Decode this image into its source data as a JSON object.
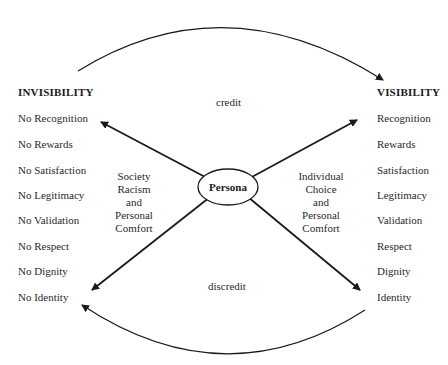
{
  "left": {
    "heading": "INVISIBILITY",
    "items": [
      "No Recognition",
      "No Rewards",
      "No Satisfaction",
      "No Legitimacy",
      "No Validation",
      "No Respect",
      "No Dignity",
      "No Identity"
    ]
  },
  "right": {
    "heading": "VISIBILITY",
    "items": [
      "Recognition",
      "Rewards",
      "Satisfaction",
      "Legitimacy",
      "Validation",
      "Respect",
      "Dignity",
      "Identity"
    ]
  },
  "center": {
    "label": "Persona",
    "top_label": "credit",
    "bottom_label": "discredit",
    "left_factors": [
      "Society",
      "Racism",
      "and",
      "Personal",
      "Comfort"
    ],
    "right_factors": [
      "Individual",
      "Choice",
      "and",
      "Personal",
      "Comfort"
    ]
  },
  "colors": {
    "line": "#1a1a1a",
    "text": "#2a2a2a",
    "background": "#ffffff"
  }
}
